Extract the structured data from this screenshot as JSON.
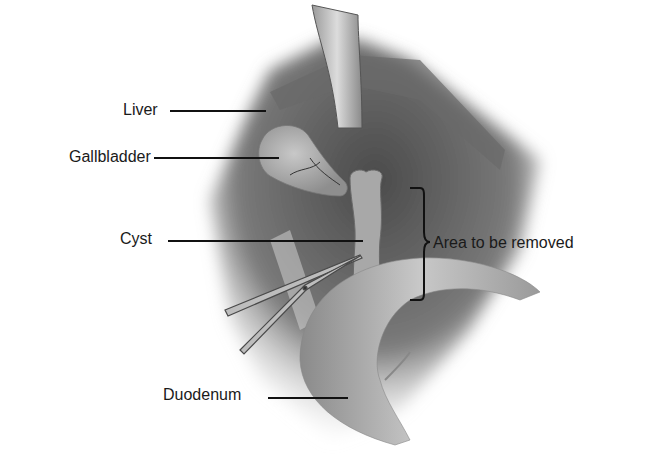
{
  "figure": {
    "colors": {
      "background": "#ffffff",
      "tissue_dark": "#5a5a5a",
      "tissue_mid": "#8c8c8c",
      "tissue_light": "#c4c4c4",
      "label_text": "#1a1a1a"
    }
  },
  "labels": [
    {
      "id": "liver",
      "text": "Liver"
    },
    {
      "id": "gallbladder",
      "text": "Gallbladder"
    },
    {
      "id": "cyst",
      "text": "Cyst"
    },
    {
      "id": "area",
      "text": "Area to be removed"
    },
    {
      "id": "duodenum",
      "text": "Duodenum"
    }
  ]
}
